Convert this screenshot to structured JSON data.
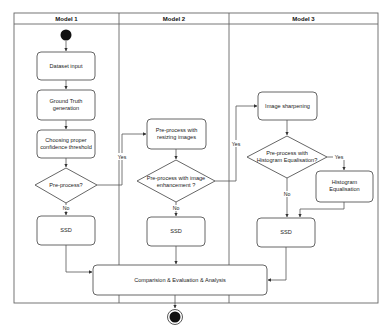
{
  "diagram": {
    "type": "swimlane-activity-diagram",
    "lanes": [
      {
        "id": "model1",
        "title": "Model 1"
      },
      {
        "id": "model2",
        "title": "Model 2"
      },
      {
        "id": "model3",
        "title": "Model 3"
      }
    ],
    "nodes": {
      "start": {
        "type": "initial"
      },
      "dataset_input": {
        "label": "Dataset input",
        "lane": "model1"
      },
      "ground_truth": {
        "label_line1": "Ground Truth",
        "label_line2": "generation",
        "lane": "model1"
      },
      "choosing_threshold": {
        "label_line1": "Choosing proper",
        "label_line2": "confidence threshold",
        "lane": "model1"
      },
      "preprocess_decision": {
        "label": "Pre-process?",
        "lane": "model1"
      },
      "ssd1": {
        "label": "SSD",
        "lane": "model1"
      },
      "resizing": {
        "label_line1": "Pre-process with",
        "label_line2": "resizing images",
        "lane": "model2"
      },
      "enhancement_decision": {
        "label_line1": "Pre-process with image",
        "label_line2": "enhancement ?",
        "lane": "model2"
      },
      "ssd2": {
        "label": "SSD",
        "lane": "model2"
      },
      "sharpening": {
        "label": "Image sharpening",
        "lane": "model3"
      },
      "histeq_decision": {
        "label_line1": "Pre-process with",
        "label_line2": "Histogram Equalisation?",
        "lane": "model3"
      },
      "histeq": {
        "label_line1": "Histogram",
        "label_line2": "Equalisation",
        "lane": "model3"
      },
      "ssd3": {
        "label": "SSD",
        "lane": "model3"
      },
      "comparison": {
        "label": "Comparision & Evaluation & Analysis"
      },
      "end": {
        "type": "final"
      }
    },
    "edge_labels": {
      "yes1": "Yes",
      "no1": "No",
      "yes2": "Yes",
      "no2": "No",
      "yes3": "Yes",
      "no3": "No"
    },
    "edges": [
      {
        "from": "start",
        "to": "dataset_input"
      },
      {
        "from": "dataset_input",
        "to": "ground_truth"
      },
      {
        "from": "ground_truth",
        "to": "choosing_threshold"
      },
      {
        "from": "choosing_threshold",
        "to": "preprocess_decision"
      },
      {
        "from": "preprocess_decision",
        "to": "ssd1",
        "label": "No"
      },
      {
        "from": "preprocess_decision",
        "to": "resizing",
        "label": "Yes"
      },
      {
        "from": "resizing",
        "to": "enhancement_decision"
      },
      {
        "from": "enhancement_decision",
        "to": "ssd2",
        "label": "No"
      },
      {
        "from": "enhancement_decision",
        "to": "sharpening",
        "label": "Yes"
      },
      {
        "from": "sharpening",
        "to": "histeq_decision"
      },
      {
        "from": "histeq_decision",
        "to": "ssd3",
        "label": "No"
      },
      {
        "from": "histeq_decision",
        "to": "histeq",
        "label": "Yes"
      },
      {
        "from": "histeq",
        "to": "ssd3"
      },
      {
        "from": "ssd1",
        "to": "comparison"
      },
      {
        "from": "ssd2",
        "to": "comparison"
      },
      {
        "from": "ssd3",
        "to": "comparison"
      },
      {
        "from": "comparison",
        "to": "end"
      }
    ]
  }
}
